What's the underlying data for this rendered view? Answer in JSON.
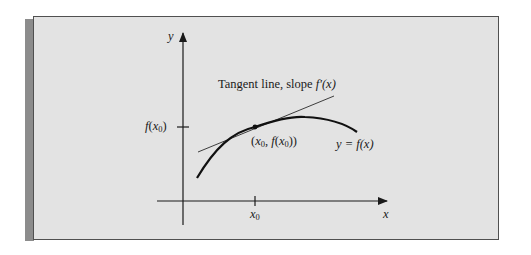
{
  "figure": {
    "colors": {
      "background": "#e3e3e3",
      "border": "#505050",
      "shadow_strip": "#8c8c8c",
      "ink": "#1a1a1a"
    },
    "axes": {
      "y_label": "y",
      "x_label": "x"
    },
    "ticks": {
      "y_tick_label_fn": "f",
      "y_tick_label_open": "(",
      "y_tick_label_var": "x",
      "y_tick_label_sub": "0",
      "y_tick_label_close": ")",
      "x_tick_label_var": "x",
      "x_tick_label_sub": "0"
    },
    "annotations": {
      "tangent_label_text": "Tangent line, slope ",
      "tangent_label_fn": "f′(x)",
      "point_label_open": "(",
      "point_label_x": "x",
      "point_label_x_sub": "0",
      "point_label_sep": ", ",
      "point_label_fn": "f",
      "point_label_inner_open": "(",
      "point_label_inner_x": "x",
      "point_label_inner_sub": "0",
      "point_label_close": "))",
      "curve_label": "y = f(x)"
    },
    "geometry": {
      "curve": "y = f(x), concave down, increasing then slightly decreasing",
      "tangent_point": "(x0, f(x0))"
    }
  }
}
